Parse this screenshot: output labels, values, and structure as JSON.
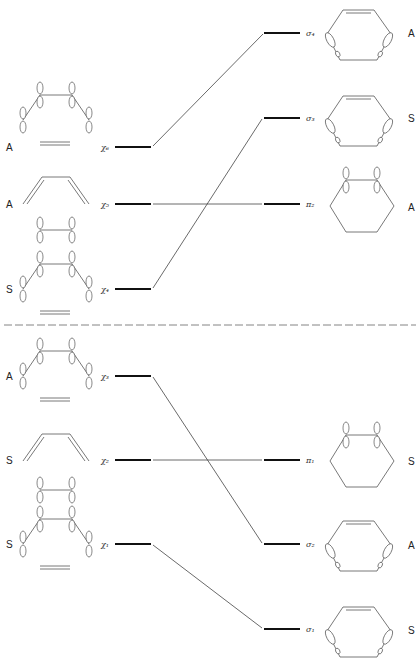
{
  "diagram": {
    "divider_y": 325,
    "left_levels": [
      {
        "id": "chi6",
        "label": "χ₆",
        "symmetry": "A",
        "y": 147
      },
      {
        "id": "chi5",
        "label": "χ₅",
        "symmetry": "A",
        "y": 204
      },
      {
        "id": "chi4",
        "label": "χ₄",
        "symmetry": "S",
        "y": 289
      },
      {
        "id": "chi3",
        "label": "χ₃",
        "symmetry": "A",
        "y": 376
      },
      {
        "id": "chi2",
        "label": "χ₂",
        "symmetry": "S",
        "y": 460
      },
      {
        "id": "chi1",
        "label": "χ₁",
        "symmetry": "S",
        "y": 544
      }
    ],
    "right_levels": [
      {
        "id": "sigma4",
        "label": "σ₄",
        "symmetry": "A",
        "y": 33
      },
      {
        "id": "sigma3",
        "label": "σ₃",
        "symmetry": "S",
        "y": 118
      },
      {
        "id": "pi2",
        "label": "π₂",
        "symmetry": "A",
        "y": 204
      },
      {
        "id": "pi1",
        "label": "π₁",
        "symmetry": "S",
        "y": 460
      },
      {
        "id": "sigma2",
        "label": "σ₂",
        "symmetry": "A",
        "y": 544
      },
      {
        "id": "sigma1",
        "label": "σ₁",
        "symmetry": "S",
        "y": 629
      }
    ],
    "correlations": [
      {
        "from": "chi6",
        "to": "sigma4"
      },
      {
        "from": "chi5",
        "to": "pi2"
      },
      {
        "from": "chi4",
        "to": "sigma3"
      },
      {
        "from": "chi3",
        "to": "sigma2"
      },
      {
        "from": "chi2",
        "to": "pi1"
      },
      {
        "from": "chi1",
        "to": "sigma1"
      }
    ],
    "colors": {
      "line": "#111111",
      "background": "#ffffff"
    }
  }
}
